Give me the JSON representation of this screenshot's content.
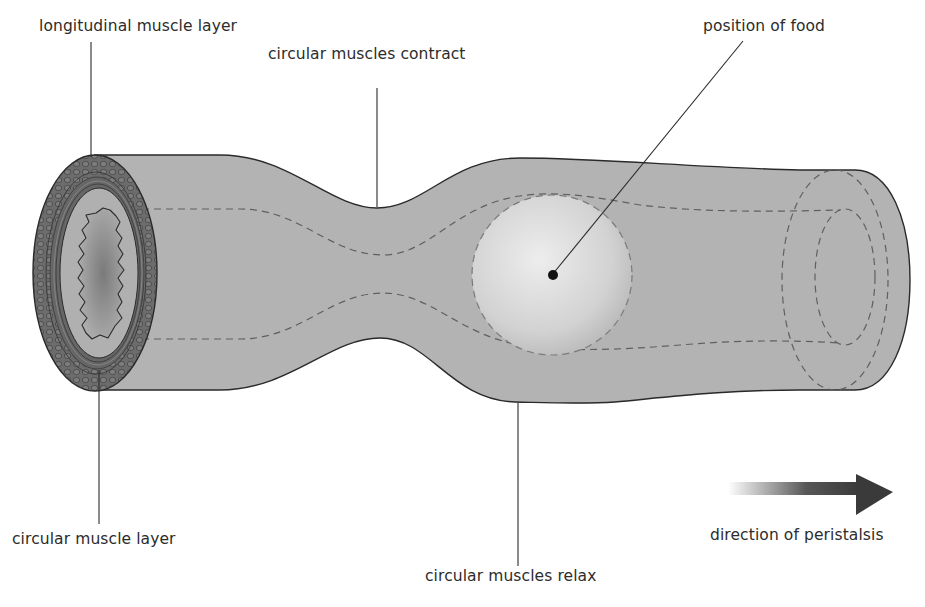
{
  "labels": {
    "longitudinal_muscle_layer": "longitudinal muscle layer",
    "circular_muscles_contract": "circular muscles contract",
    "position_of_food": "position of food",
    "circular_muscle_layer": "circular muscle layer",
    "circular_muscles_relax": "circular muscles relax",
    "direction_of_peristalsis": "direction of peristalsis"
  },
  "colors": {
    "tube_fill": "#b3b3b3",
    "tube_outline": "#2a2a2a",
    "muscle_ring": "#6e6e6e",
    "lumen": "#8e8e8e",
    "food_bolus": "#d9d9d9",
    "dashed_lumen_line": "#606060",
    "arrow": "#3a3a3a",
    "text": "#2c2c2c"
  },
  "icons": {
    "direction_arrow": "right-arrow-gradient",
    "food_marker": "filled-dot"
  }
}
